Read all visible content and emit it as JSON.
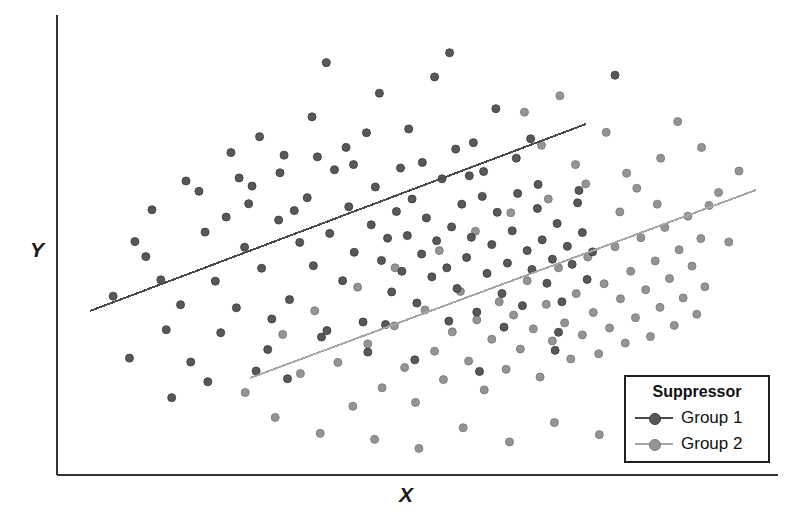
{
  "figure": {
    "background": "#ffffff",
    "width": 803,
    "height": 529
  },
  "axes": {
    "color": "#333333",
    "x_axis_label": "X",
    "y_axis_label": "Y",
    "x_start_px": 57,
    "x_end_px": 778,
    "y_top_px": 15,
    "y_bottom_px": 475
  },
  "legend": {
    "title": "Suppressor",
    "position": "bottom-right",
    "border_color": "#1f1f1f",
    "entries": [
      {
        "label": "Group 1",
        "color": "#555555"
      },
      {
        "label": "Group 2",
        "color": "#8f8f8f"
      }
    ]
  },
  "chart_data": {
    "type": "scatter",
    "title": "",
    "xlabel": "X",
    "ylabel": "Y",
    "grid": false,
    "xlim": [
      0,
      100
    ],
    "ylim": [
      0,
      100
    ],
    "axis_ticks": false,
    "legend_title": "Suppressor",
    "legend_position": "lower right",
    "marker": "circle",
    "marker_size_px": 8,
    "series": [
      {
        "name": "Group 1",
        "color": "#555555",
        "marker_fill": "#585858",
        "marker_edge": "#3d3d3d",
        "points": [
          [
            5.6,
            37.4
          ],
          [
            11.3,
            57.5
          ],
          [
            13.4,
            29.6
          ],
          [
            14.2,
            13.8
          ],
          [
            17.0,
            22.1
          ],
          [
            10.4,
            46.6
          ],
          [
            19.5,
            17.5
          ],
          [
            22.2,
            55.8
          ],
          [
            20.6,
            40.9
          ],
          [
            23.7,
            34.7
          ],
          [
            24.9,
            48.8
          ],
          [
            26.0,
            63.0
          ],
          [
            27.4,
            43.9
          ],
          [
            28.3,
            25.0
          ],
          [
            29.9,
            55.1
          ],
          [
            30.7,
            70.2
          ],
          [
            31.5,
            36.6
          ],
          [
            33.0,
            49.9
          ],
          [
            34.1,
            60.3
          ],
          [
            35.0,
            44.5
          ],
          [
            36.2,
            27.9
          ],
          [
            37.4,
            52.0
          ],
          [
            38.1,
            66.8
          ],
          [
            39.3,
            41.0
          ],
          [
            40.2,
            58.2
          ],
          [
            41.0,
            47.6
          ],
          [
            42.3,
            31.4
          ],
          [
            43.5,
            54.0
          ],
          [
            44.1,
            62.8
          ],
          [
            45.0,
            45.7
          ],
          [
            45.9,
            50.9
          ],
          [
            46.5,
            38.4
          ],
          [
            47.2,
            57.1
          ],
          [
            48.0,
            43.2
          ],
          [
            48.8,
            51.5
          ],
          [
            49.5,
            60.0
          ],
          [
            50.2,
            35.8
          ],
          [
            50.9,
            47.2
          ],
          [
            51.6,
            55.6
          ],
          [
            52.4,
            41.9
          ],
          [
            53.1,
            50.3
          ],
          [
            53.9,
            64.7
          ],
          [
            54.6,
            44.0
          ],
          [
            55.3,
            53.5
          ],
          [
            56.1,
            39.2
          ],
          [
            56.8,
            58.8
          ],
          [
            57.5,
            46.4
          ],
          [
            58.2,
            51.1
          ],
          [
            59.0,
            33.7
          ],
          [
            59.8,
            60.6
          ],
          [
            60.5,
            42.7
          ],
          [
            61.2,
            49.4
          ],
          [
            62.0,
            56.9
          ],
          [
            62.7,
            38.0
          ],
          [
            63.5,
            45.1
          ],
          [
            64.2,
            52.6
          ],
          [
            65.0,
            61.3
          ],
          [
            65.7,
            35.2
          ],
          [
            66.4,
            48.0
          ],
          [
            67.1,
            43.6
          ],
          [
            67.9,
            57.8
          ],
          [
            68.6,
            50.5
          ],
          [
            69.3,
            40.4
          ],
          [
            70.1,
            46.0
          ],
          [
            70.8,
            54.3
          ],
          [
            71.5,
            36.1
          ],
          [
            72.3,
            49.0
          ],
          [
            73.0,
            44.8
          ],
          [
            73.8,
            59.1
          ],
          [
            74.5,
            52.2
          ],
          [
            75.2,
            41.3
          ],
          [
            76.0,
            47.7
          ],
          [
            22.9,
            70.8
          ],
          [
            27.1,
            74.5
          ],
          [
            34.8,
            79.1
          ],
          [
            39.8,
            72.0
          ],
          [
            44.7,
            84.6
          ],
          [
            49.0,
            76.3
          ],
          [
            52.8,
            88.4
          ],
          [
            58.5,
            73.1
          ],
          [
            61.8,
            81.0
          ],
          [
            64.8,
            69.5
          ],
          [
            16.3,
            64.2
          ],
          [
            19.1,
            52.3
          ],
          [
            25.5,
            58.9
          ],
          [
            30.1,
            66.1
          ],
          [
            35.6,
            69.8
          ],
          [
            42.8,
            75.4
          ],
          [
            47.8,
            67.2
          ],
          [
            55.9,
            71.6
          ],
          [
            60.0,
            66.4
          ],
          [
            66.9,
            74.0
          ],
          [
            8.8,
            50.1
          ],
          [
            12.6,
            41.2
          ],
          [
            15.5,
            35.4
          ],
          [
            18.2,
            61.8
          ],
          [
            21.4,
            28.9
          ],
          [
            24.1,
            64.9
          ],
          [
            28.9,
            32.1
          ],
          [
            32.2,
            57.3
          ],
          [
            37.0,
            29.4
          ],
          [
            40.9,
            68.0
          ],
          [
            45.6,
            30.8
          ],
          [
            51.0,
            68.5
          ],
          [
            54.9,
            31.6
          ],
          [
            57.9,
            65.4
          ],
          [
            63.0,
            30.2
          ],
          [
            68.0,
            63.4
          ],
          [
            71.0,
            29.0
          ],
          [
            74.0,
            62.0
          ],
          [
            36.9,
            91.7
          ],
          [
            55.0,
            94.0
          ],
          [
            79.3,
            88.8
          ],
          [
            43.0,
            24.4
          ],
          [
            26.6,
            20.0
          ],
          [
            31.2,
            18.2
          ],
          [
            49.9,
            22.6
          ],
          [
            59.4,
            19.9
          ],
          [
            70.5,
            24.8
          ],
          [
            8.0,
            23.0
          ]
        ]
      },
      {
        "name": "Group 2",
        "color": "#8f8f8f",
        "marker_fill": "#949494",
        "marker_edge": "#7a7a7a",
        "points": [
          [
            25.0,
            15.0
          ],
          [
            29.4,
            9.2
          ],
          [
            33.1,
            19.4
          ],
          [
            36.0,
            5.5
          ],
          [
            38.6,
            22.0
          ],
          [
            40.8,
            11.8
          ],
          [
            43.0,
            26.3
          ],
          [
            45.1,
            16.1
          ],
          [
            46.9,
            30.5
          ],
          [
            48.4,
            20.8
          ],
          [
            50.0,
            12.7
          ],
          [
            51.4,
            34.2
          ],
          [
            52.8,
            24.6
          ],
          [
            54.1,
            18.0
          ],
          [
            55.4,
            29.1
          ],
          [
            56.6,
            38.5
          ],
          [
            57.8,
            22.3
          ],
          [
            59.0,
            31.9
          ],
          [
            60.1,
            15.6
          ],
          [
            61.2,
            27.4
          ],
          [
            62.3,
            36.1
          ],
          [
            63.3,
            20.4
          ],
          [
            64.4,
            33.0
          ],
          [
            65.4,
            25.1
          ],
          [
            66.4,
            41.0
          ],
          [
            67.3,
            29.8
          ],
          [
            68.3,
            18.6
          ],
          [
            69.2,
            35.5
          ],
          [
            70.1,
            27.0
          ],
          [
            71.0,
            44.0
          ],
          [
            71.9,
            31.2
          ],
          [
            72.8,
            22.8
          ],
          [
            73.6,
            38.0
          ],
          [
            74.5,
            28.4
          ],
          [
            75.3,
            46.5
          ],
          [
            76.1,
            33.6
          ],
          [
            76.9,
            24.0
          ],
          [
            77.7,
            40.3
          ],
          [
            78.5,
            30.0
          ],
          [
            79.3,
            48.9
          ],
          [
            80.1,
            36.8
          ],
          [
            80.8,
            26.5
          ],
          [
            81.6,
            43.2
          ],
          [
            82.3,
            32.4
          ],
          [
            83.1,
            51.0
          ],
          [
            83.8,
            38.9
          ],
          [
            84.5,
            28.0
          ],
          [
            85.2,
            45.6
          ],
          [
            85.9,
            34.8
          ],
          [
            86.6,
            53.4
          ],
          [
            87.3,
            41.5
          ],
          [
            88.0,
            30.6
          ],
          [
            88.7,
            48.2
          ],
          [
            89.3,
            37.0
          ],
          [
            90.0,
            56.0
          ],
          [
            90.6,
            44.4
          ],
          [
            91.3,
            33.2
          ],
          [
            91.9,
            50.8
          ],
          [
            92.5,
            39.6
          ],
          [
            93.1,
            58.5
          ],
          [
            30.5,
            28.5
          ],
          [
            35.2,
            34.0
          ],
          [
            41.5,
            39.5
          ],
          [
            47.0,
            44.0
          ],
          [
            53.5,
            48.0
          ],
          [
            58.8,
            52.5
          ],
          [
            64.0,
            56.8
          ],
          [
            69.5,
            60.0
          ],
          [
            75.0,
            63.5
          ],
          [
            81.0,
            66.0
          ],
          [
            86.0,
            69.5
          ],
          [
            92.0,
            72.0
          ],
          [
            44.0,
            4.1
          ],
          [
            50.5,
            2.0
          ],
          [
            57.0,
            6.8
          ],
          [
            63.8,
            3.5
          ],
          [
            70.4,
            8.0
          ],
          [
            77.0,
            5.2
          ],
          [
            84.0,
            9.6
          ],
          [
            89.5,
            7.0
          ],
          [
            68.5,
            72.5
          ],
          [
            73.5,
            68.0
          ],
          [
            78.0,
            75.5
          ],
          [
            82.5,
            62.5
          ],
          [
            88.5,
            78.0
          ],
          [
            94.5,
            61.5
          ],
          [
            96.0,
            50.0
          ],
          [
            97.5,
            66.5
          ],
          [
            66.0,
            80.2
          ],
          [
            71.2,
            84.0
          ],
          [
            80.0,
            57.0
          ],
          [
            85.5,
            58.8
          ]
        ]
      }
    ],
    "trend_lines": [
      {
        "series": "Group 1",
        "color": "#4a4a4a",
        "width_px": 2,
        "x1_px": 90,
        "y1_px": 311,
        "x2_px": 586,
        "y2_px": 124
      },
      {
        "series": "Group 2",
        "color": "#a5a5a5",
        "width_px": 2,
        "x1_px": 250,
        "y1_px": 378,
        "x2_px": 756,
        "y2_px": 190
      }
    ]
  }
}
